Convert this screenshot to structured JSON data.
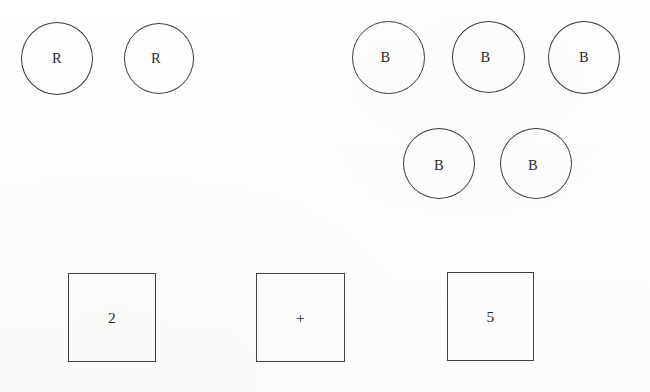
{
  "canvas": {
    "width": 650,
    "height": 392,
    "background_color": "#fefefe",
    "ink_color": "#3b3b3f",
    "text_color": "#2a2a2e"
  },
  "groups": [
    {
      "name": "red-group",
      "shape": "circle",
      "label": "R",
      "count": 2
    },
    {
      "name": "blue-group",
      "shape": "circle",
      "label": "B",
      "count": 5
    },
    {
      "name": "equation-group",
      "shape": "square",
      "count": 3
    }
  ],
  "circles": [
    {
      "id": "r-circle-1",
      "label": "R",
      "x": 21,
      "y": 22,
      "w": 72,
      "h": 73
    },
    {
      "id": "r-circle-2",
      "label": "R",
      "x": 124,
      "y": 23,
      "w": 70,
      "h": 71
    },
    {
      "id": "b-circle-1",
      "label": "B",
      "x": 352,
      "y": 21,
      "w": 73,
      "h": 73
    },
    {
      "id": "b-circle-2",
      "label": "B",
      "x": 452,
      "y": 21,
      "w": 73,
      "h": 72
    },
    {
      "id": "b-circle-3",
      "label": "B",
      "x": 548,
      "y": 21,
      "w": 72,
      "h": 73
    },
    {
      "id": "b-circle-4",
      "label": "B",
      "x": 403,
      "y": 128,
      "w": 72,
      "h": 71
    },
    {
      "id": "b-circle-5",
      "label": "B",
      "x": 500,
      "y": 128,
      "w": 72,
      "h": 71
    }
  ],
  "squares": [
    {
      "id": "square-operand-1",
      "label": "2",
      "x": 68,
      "y": 273,
      "w": 88,
      "h": 89
    },
    {
      "id": "square-operator",
      "label": "+",
      "x": 256,
      "y": 273,
      "w": 89,
      "h": 89
    },
    {
      "id": "square-operand-2",
      "label": "5",
      "x": 447,
      "y": 272,
      "w": 87,
      "h": 89
    }
  ]
}
